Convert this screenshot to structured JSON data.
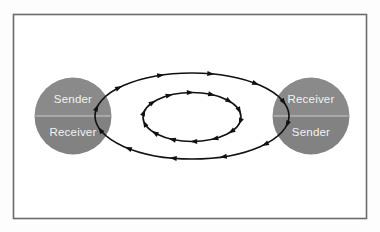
{
  "figure": {
    "title": "Sender-Receiver bidirectional communication loop",
    "background_color": "#fdfdfd",
    "frame": {
      "border_color": "#6b6b6b",
      "fill_color": "#ffffff",
      "x": 13,
      "y": 14,
      "width": 353,
      "height": 204
    },
    "nodes": [
      {
        "id": "left-node",
        "center_x": 73,
        "center_y": 116,
        "radius": 38.5,
        "top_label": "Sender",
        "bottom_label": "Receiver",
        "top_fill": "#8a8a8a",
        "bottom_fill": "#828282",
        "divider_color": "#c9c9c9",
        "label_color": "#f2f2f2"
      },
      {
        "id": "right-node",
        "center_x": 311,
        "center_y": 116,
        "radius": 38.5,
        "top_label": "Receiver",
        "bottom_label": "Sender",
        "top_fill": "#8a8a8a",
        "bottom_fill": "#828282",
        "divider_color": "#c9c9c9",
        "label_color": "#f2f2f2"
      }
    ],
    "loops": [
      {
        "id": "outer-loop",
        "center_x": 192,
        "center_y": 116,
        "radius_x": 97,
        "radius_y": 43,
        "stroke_color": "#111111",
        "stroke_width": 1.6,
        "direction": "clockwise",
        "arrow_count": 12
      },
      {
        "id": "inner-loop",
        "center_x": 192,
        "center_y": 117,
        "radius_x": 49,
        "radius_y": 24.5,
        "stroke_color": "#111111",
        "stroke_width": 1.6,
        "direction": "clockwise",
        "arrow_count": 14
      }
    ]
  }
}
